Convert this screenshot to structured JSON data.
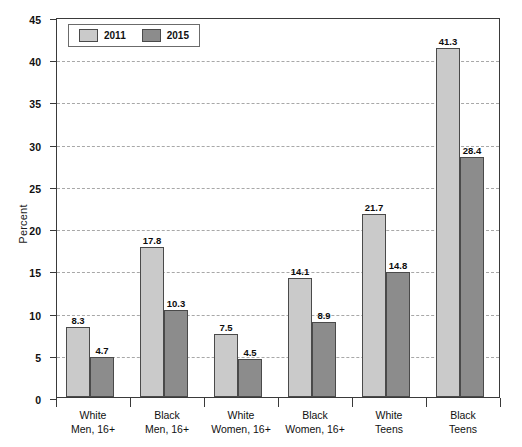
{
  "chart_data": {
    "type": "bar",
    "title": "",
    "xlabel": "",
    "ylabel": "Percent",
    "ylim": [
      0,
      45
    ],
    "ytick_step": 5,
    "yticks": [
      0,
      5,
      10,
      15,
      20,
      25,
      30,
      35,
      40,
      45
    ],
    "grid": true,
    "grid_axis": "y",
    "grid_style": "dashed",
    "legend_position": "top-left",
    "categories": [
      "White\nMen, 16+",
      "Black\nMen, 16+",
      "White\nWomen, 16+",
      "Black\nWomen, 16+",
      "White\nTeens",
      "Black\nTeens"
    ],
    "category_lines": [
      [
        "White",
        "Men, 16+"
      ],
      [
        "Black",
        "Men, 16+"
      ],
      [
        "White",
        "Women, 16+"
      ],
      [
        "Black",
        "Women, 16+"
      ],
      [
        "White",
        "Teens"
      ],
      [
        "Black",
        "Teens"
      ]
    ],
    "series": [
      {
        "name": "2011",
        "color": "#cacaca",
        "values": [
          8.3,
          17.8,
          7.5,
          14.1,
          21.7,
          41.3
        ],
        "labels": [
          "8.3",
          "17.8",
          "7.5",
          "14.1",
          "21.7",
          "41.3"
        ]
      },
      {
        "name": "2015",
        "color": "#8c8c8c",
        "values": [
          4.7,
          10.3,
          4.5,
          8.9,
          14.8,
          28.4
        ],
        "labels": [
          "4.7",
          "10.3",
          "4.5",
          "8.9",
          "14.8",
          "28.4"
        ]
      }
    ]
  },
  "axis": {
    "y_title": "Percent",
    "y_tick_labels": [
      "0",
      "5",
      "10",
      "15",
      "20",
      "25",
      "30",
      "35",
      "40",
      "45"
    ]
  },
  "legend": {
    "items": [
      {
        "label": "2011",
        "color": "#cacaca"
      },
      {
        "label": "2015",
        "color": "#8c8c8c"
      }
    ]
  },
  "colors": {
    "series_2011": "#cacaca",
    "series_2015": "#8c8c8c",
    "axis": "#3a3a3a",
    "grid": "#a8a8a8",
    "text": "#111111",
    "background": "#ffffff"
  }
}
